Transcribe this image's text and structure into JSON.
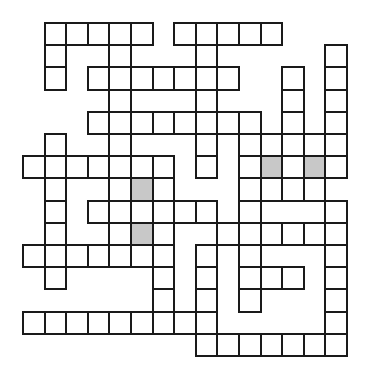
{
  "puzzle": {
    "type": "crossword",
    "columns": 15,
    "rows": 15,
    "legend": {
      "#": "blank",
      ".": "white-cell",
      "s": "shaded-cell"
    },
    "colors": {
      "cell_fill": "#ffffff",
      "shaded_fill": "#c8c8c8",
      "border": "#1a1a1a",
      "background": "#ffffff"
    },
    "grid": [
      "#.....#.....###",
      "#.##.###.#####.",
      "#.#.......##.#.",
      "####.###.###.#.",
      "###........#.#.",
      "#.##.###.#.....",
      ".......#.#.s.s.",
      "#.##.s.###....#",
      "#.#......#.###.",
      "#.##.s.##......",
      ".......#.#.###.",
      "#.####.#.#...#.",
      "######.#.#.###.",
      ".........#####.",
      "########......."
    ]
  }
}
